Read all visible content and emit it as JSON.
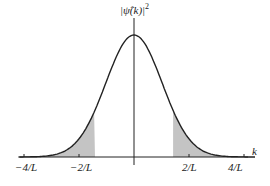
{
  "figure": {
    "ylabel": "|ψ̂(k)|²",
    "ylabel_base": "|ψ̂(k)|",
    "ylabel_sup": "2",
    "xlabel": "k",
    "ticks": [
      {
        "label": "−4/L",
        "k": -4
      },
      {
        "label": "−2/L",
        "k": -2
      },
      {
        "label": "2/L",
        "k": 2
      },
      {
        "label": "4/L",
        "k": 4
      }
    ],
    "shaded_region_cut": 1.42,
    "colors": {
      "curve": "#222222",
      "axis": "#222222",
      "shade": "#c4c4c4"
    }
  },
  "chart_data": {
    "type": "area",
    "title": "",
    "xlabel": "k",
    "ylabel": "|ψ̂(k)|²",
    "x_ticks": [
      "−4/L",
      "−2/L",
      "2/L",
      "4/L"
    ],
    "x_tick_values": [
      -4,
      -2,
      2,
      4
    ],
    "xlim": [
      -4.2,
      4.4
    ],
    "curve": {
      "shape": "gaussian",
      "center": 0,
      "sigma_in_units_of_1_over_L": 1.0,
      "peak": 1.0
    },
    "shaded_regions": [
      {
        "from": -4.2,
        "to": -1.42
      },
      {
        "from": 1.42,
        "to": 4.4
      }
    ],
    "grid": false,
    "legend": "none"
  }
}
